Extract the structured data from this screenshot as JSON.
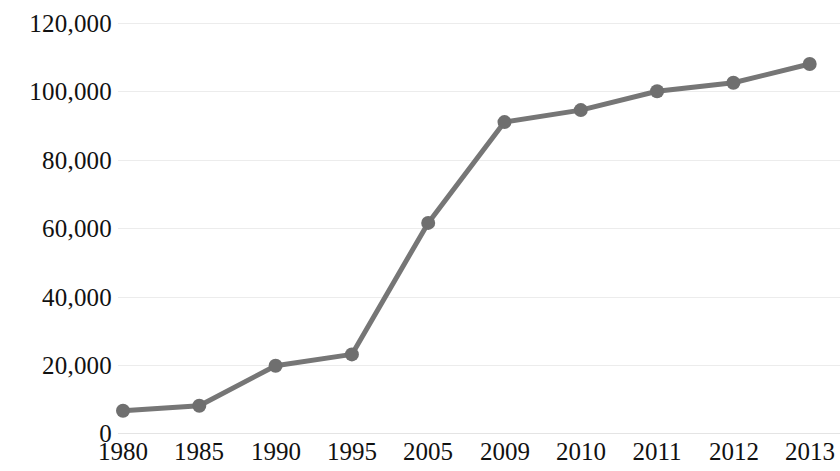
{
  "chart_data": {
    "type": "line",
    "title": "",
    "subtitle": "",
    "xlabel": "",
    "ylabel": "",
    "categories": [
      "1980",
      "1985",
      "1990",
      "1995",
      "2005",
      "2009",
      "2010",
      "2011",
      "2012",
      "2013"
    ],
    "series": [
      {
        "name": "",
        "values": [
          6500,
          8000,
          19700,
          23000,
          61500,
          91000,
          94500,
          100000,
          102500,
          108000
        ]
      }
    ],
    "ylim": [
      0,
      120000
    ],
    "y_ticks": [
      0,
      20000,
      40000,
      60000,
      80000,
      100000,
      120000
    ],
    "y_tick_labels": [
      "0",
      "20,000",
      "40,000",
      "60,000",
      "80,000",
      "100,000",
      "120,000"
    ],
    "grid": true,
    "grid_axis": "y",
    "legend": false,
    "legend_position": "none",
    "markers": true,
    "colors": {
      "line": "#767676",
      "marker": "#6f6f6f",
      "gridline": "#ececec",
      "text": "#111111",
      "background": "#ffffff"
    }
  }
}
